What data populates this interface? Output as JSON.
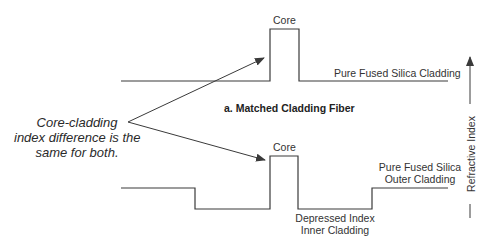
{
  "title": "a. Matched Cladding Fiber",
  "annotation": {
    "lines": [
      "Core-cladding",
      "index difference is the",
      "same for both."
    ]
  },
  "top_profile": {
    "core_label": "Core",
    "cladding_label": "Pure Fused Silica Cladding"
  },
  "bottom_profile": {
    "core_label": "Core",
    "outer_cladding_label": [
      "Pure Fused Silica",
      "Outer Cladding"
    ],
    "inner_cladding_label": [
      "Depressed Index",
      "Inner Cladding"
    ]
  },
  "axis": {
    "label": "Refractive Index"
  },
  "colors": {
    "line": "#3a3a3a",
    "background": "#ffffff"
  }
}
